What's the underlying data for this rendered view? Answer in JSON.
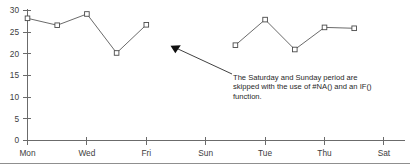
{
  "chart_data": {
    "type": "line",
    "title": "",
    "subtitle": "",
    "xlabel": "",
    "ylabel": "",
    "grid": false,
    "legend": "none",
    "ylim": [
      0,
      30
    ],
    "yticks": [
      0,
      5,
      10,
      15,
      20,
      25,
      30
    ],
    "ytick_labels": [
      "0",
      "5",
      "10",
      "15",
      "20",
      "25",
      "30"
    ],
    "xtick_labels": [
      "Mon",
      "Wed",
      "Fri",
      "Sun",
      "Tue",
      "Thu",
      "Sat"
    ],
    "x_categories": [
      "Mon",
      "Tue",
      "Wed",
      "Thu",
      "Fri",
      "Sat",
      "Sun",
      "Mon",
      "Tue",
      "Wed",
      "Thu",
      "Fri",
      "Sat"
    ],
    "series": [
      {
        "name": "Daily value",
        "values": [
          28.2,
          26.6,
          29.2,
          20.2,
          26.7,
          null,
          null,
          22.0,
          27.9,
          21.0,
          26.1,
          25.9,
          null
        ],
        "marker": "open-square",
        "line_color": "#595959",
        "marker_fill": "#ffffff",
        "marker_stroke": "#4a4a4a"
      }
    ],
    "annotations": [
      {
        "id": "na-note",
        "lines": [
          "The Saturday and Sunday period are",
          "skipped with the use of #NA() and an IF()",
          "function."
        ],
        "target_category": "Sat",
        "has_arrow": true
      }
    ]
  },
  "colors": {
    "axis": "#6b6b6b",
    "series": "#595959",
    "text": "#1f1f1f",
    "background": "#ffffff",
    "footer_rule": "#8f8f8f"
  }
}
